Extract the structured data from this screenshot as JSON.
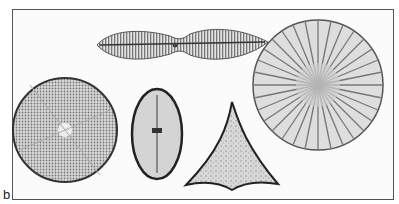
{
  "figure": {
    "panel_label": "b",
    "specimens": [
      {
        "shape": "constricted-elliptical pennate",
        "position": "top-center"
      },
      {
        "shape": "circular centric with radial sectors",
        "position": "bottom-left"
      },
      {
        "shape": "elliptical pennate",
        "position": "bottom-center"
      },
      {
        "shape": "triangular",
        "position": "bottom-center-right"
      },
      {
        "shape": "circular centric with radial striae",
        "position": "right"
      }
    ]
  }
}
